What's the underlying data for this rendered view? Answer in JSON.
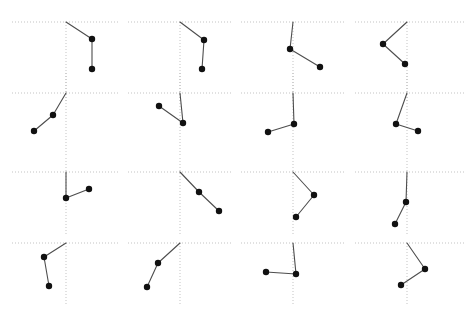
{
  "figure": {
    "title": "",
    "width": 476,
    "height": 322,
    "background_color": "#ffffff",
    "grid_rows": 4,
    "grid_cols": 4,
    "panel_count": 16
  },
  "style": {
    "axis_color": "#b4b4b4",
    "axis_dash": "1,2",
    "axis_width": 0.8,
    "line_color": "#4d4d4d",
    "line_width": 1.1,
    "marker_color": "#111111",
    "marker_radius": 3.2,
    "origin_marker": "none"
  },
  "chart_data": {
    "type": "line",
    "title": "",
    "subtitle": "",
    "xlabel": "",
    "ylabel": "",
    "legend": [],
    "grid": true,
    "layout": "4x4 small multiples",
    "axis_note": "Each panel shows a dotted horizontal axis and a dotted vertical axis crossing at the panel origin; values are pixel offsets from that origin, y positive downward.",
    "panels": [
      {
        "index": 1,
        "row": 1,
        "col": 1,
        "origin": [
          66,
          22
        ],
        "axis_h_extent": [
          12,
          118
        ],
        "axis_v_extent": [
          0,
          80
        ],
        "points": [
          [
            0,
            0
          ],
          [
            26,
            17
          ],
          [
            26,
            47
          ]
        ],
        "markers": [
          false,
          true,
          true
        ]
      },
      {
        "index": 2,
        "row": 1,
        "col": 2,
        "origin": [
          180,
          22
        ],
        "axis_h_extent": [
          128,
          232
        ],
        "axis_v_extent": [
          0,
          80
        ],
        "points": [
          [
            0,
            0
          ],
          [
            24,
            18
          ],
          [
            22,
            47
          ]
        ],
        "markers": [
          false,
          true,
          true
        ]
      },
      {
        "index": 3,
        "row": 1,
        "col": 3,
        "origin": [
          293,
          22
        ],
        "axis_h_extent": [
          241,
          345
        ],
        "axis_v_extent": [
          0,
          80
        ],
        "points": [
          [
            0,
            0
          ],
          [
            -3,
            27
          ],
          [
            27,
            45
          ]
        ],
        "markers": [
          false,
          true,
          true
        ]
      },
      {
        "index": 4,
        "row": 1,
        "col": 4,
        "origin": [
          407,
          22
        ],
        "axis_h_extent": [
          355,
          465
        ],
        "axis_v_extent": [
          0,
          80
        ],
        "points": [
          [
            0,
            0
          ],
          [
            -24,
            22
          ],
          [
            -2,
            42
          ]
        ],
        "markers": [
          false,
          true,
          true
        ]
      },
      {
        "index": 5,
        "row": 2,
        "col": 1,
        "origin": [
          66,
          93
        ],
        "axis_h_extent": [
          12,
          118
        ],
        "axis_v_extent": [
          -20,
          62
        ],
        "points": [
          [
            0,
            0
          ],
          [
            -13,
            22
          ],
          [
            -32,
            38
          ]
        ],
        "markers": [
          false,
          true,
          true
        ]
      },
      {
        "index": 6,
        "row": 2,
        "col": 2,
        "origin": [
          180,
          93
        ],
        "axis_h_extent": [
          128,
          232
        ],
        "axis_v_extent": [
          -20,
          62
        ],
        "points": [
          [
            0,
            0
          ],
          [
            3,
            30
          ],
          [
            -21,
            13
          ]
        ],
        "markers": [
          false,
          true,
          true
        ]
      },
      {
        "index": 7,
        "row": 2,
        "col": 3,
        "origin": [
          293,
          93
        ],
        "axis_h_extent": [
          241,
          345
        ],
        "axis_v_extent": [
          -20,
          62
        ],
        "points": [
          [
            0,
            0
          ],
          [
            1,
            31
          ],
          [
            -25,
            39
          ]
        ],
        "markers": [
          false,
          true,
          true
        ]
      },
      {
        "index": 8,
        "row": 2,
        "col": 4,
        "origin": [
          407,
          93
        ],
        "axis_h_extent": [
          355,
          465
        ],
        "axis_v_extent": [
          -20,
          62
        ],
        "points": [
          [
            0,
            0
          ],
          [
            -11,
            31
          ],
          [
            11,
            38
          ]
        ],
        "markers": [
          false,
          true,
          true
        ]
      },
      {
        "index": 9,
        "row": 3,
        "col": 1,
        "origin": [
          66,
          172
        ],
        "axis_h_extent": [
          12,
          118
        ],
        "axis_v_extent": [
          -14,
          64
        ],
        "points": [
          [
            0,
            0
          ],
          [
            0,
            26
          ],
          [
            23,
            17
          ]
        ],
        "markers": [
          false,
          true,
          true
        ]
      },
      {
        "index": 10,
        "row": 3,
        "col": 2,
        "origin": [
          180,
          172
        ],
        "axis_h_extent": [
          128,
          232
        ],
        "axis_v_extent": [
          -14,
          64
        ],
        "points": [
          [
            0,
            0
          ],
          [
            19,
            20
          ],
          [
            39,
            39
          ]
        ],
        "markers": [
          false,
          true,
          true
        ]
      },
      {
        "index": 11,
        "row": 3,
        "col": 3,
        "origin": [
          293,
          172
        ],
        "axis_h_extent": [
          241,
          345
        ],
        "axis_v_extent": [
          -14,
          64
        ],
        "points": [
          [
            0,
            0
          ],
          [
            21,
            23
          ],
          [
            3,
            45
          ]
        ],
        "markers": [
          false,
          true,
          true
        ]
      },
      {
        "index": 12,
        "row": 3,
        "col": 4,
        "origin": [
          407,
          172
        ],
        "axis_h_extent": [
          355,
          465
        ],
        "axis_v_extent": [
          -14,
          64
        ],
        "points": [
          [
            0,
            0
          ],
          [
            -1,
            30
          ],
          [
            -12,
            52
          ]
        ],
        "markers": [
          false,
          true,
          true
        ]
      },
      {
        "index": 13,
        "row": 4,
        "col": 1,
        "origin": [
          66,
          243
        ],
        "axis_h_extent": [
          12,
          118
        ],
        "axis_v_extent": [
          0,
          62
        ],
        "points": [
          [
            0,
            0
          ],
          [
            -22,
            14
          ],
          [
            -17,
            43
          ]
        ],
        "markers": [
          false,
          true,
          true
        ]
      },
      {
        "index": 14,
        "row": 4,
        "col": 2,
        "origin": [
          180,
          243
        ],
        "axis_h_extent": [
          128,
          232
        ],
        "axis_v_extent": [
          0,
          62
        ],
        "points": [
          [
            0,
            0
          ],
          [
            -22,
            20
          ],
          [
            -33,
            44
          ]
        ],
        "markers": [
          false,
          true,
          true
        ]
      },
      {
        "index": 15,
        "row": 4,
        "col": 3,
        "origin": [
          293,
          243
        ],
        "axis_h_extent": [
          241,
          345
        ],
        "axis_v_extent": [
          0,
          62
        ],
        "points": [
          [
            0,
            0
          ],
          [
            3,
            31
          ],
          [
            -27,
            29
          ]
        ],
        "markers": [
          false,
          true,
          true
        ]
      },
      {
        "index": 16,
        "row": 4,
        "col": 4,
        "origin": [
          407,
          243
        ],
        "axis_h_extent": [
          355,
          465
        ],
        "axis_v_extent": [
          0,
          62
        ],
        "points": [
          [
            0,
            0
          ],
          [
            18,
            26
          ],
          [
            -6,
            42
          ]
        ],
        "markers": [
          false,
          true,
          true
        ]
      }
    ]
  }
}
